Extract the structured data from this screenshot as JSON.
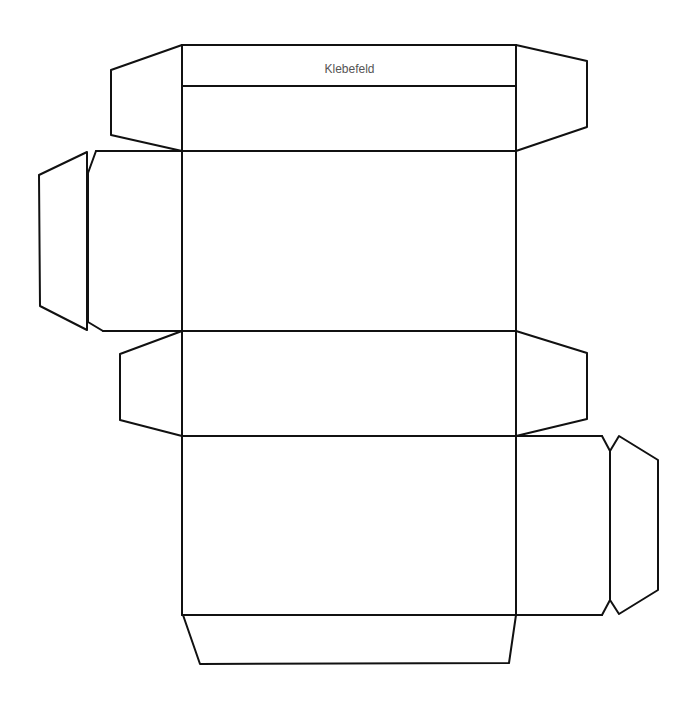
{
  "diagram": {
    "type": "box-net-template",
    "labels": {
      "glue_flap": "Klebefeld"
    },
    "stroke_color": "#111111",
    "label_color": "#555555",
    "panels": [
      {
        "name": "glue-flap-strip",
        "label_ref": "labels.glue_flap"
      },
      {
        "name": "top-panel"
      },
      {
        "name": "front-panel"
      },
      {
        "name": "middle-panel"
      },
      {
        "name": "back-panel"
      },
      {
        "name": "left-side-panel"
      },
      {
        "name": "right-side-panel"
      },
      {
        "name": "bottom-flap"
      }
    ]
  }
}
